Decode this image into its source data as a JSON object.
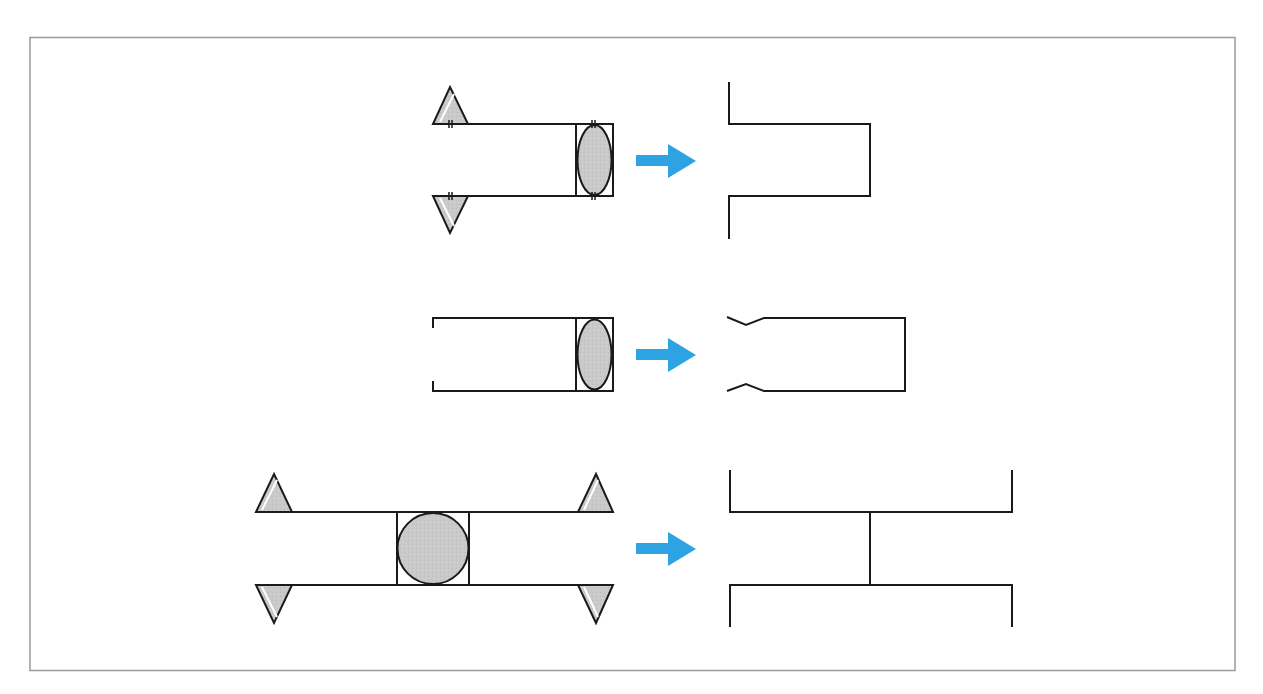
{
  "diagram": {
    "colors": {
      "background": "#ffffff",
      "frame": "#9a9a9a",
      "stroke": "#1a1a1a",
      "fill": "#c8c8c8",
      "arrow": "#2ea3e3"
    },
    "rows": [
      {
        "id": "row-1",
        "before": "channel-with-triangles-and-ellipse",
        "after": "flanged-open-rectangle"
      },
      {
        "id": "row-2",
        "before": "open-channel-with-ellipse",
        "after": "rectangle-with-kinked-opening"
      },
      {
        "id": "row-3",
        "before": "double-channel-with-circle-and-four-triangles",
        "after": "h-shaped-structure"
      }
    ]
  }
}
